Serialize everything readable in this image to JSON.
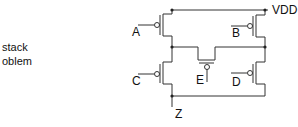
{
  "side_text": {
    "line1": "stack",
    "line2": "oblem"
  },
  "labels": {
    "vdd": "VDD",
    "z": "Z",
    "a": "A",
    "b": "B",
    "c": "C",
    "d": "D",
    "e": "E"
  },
  "colors": {
    "wire": "#333333",
    "text": "#111111"
  }
}
